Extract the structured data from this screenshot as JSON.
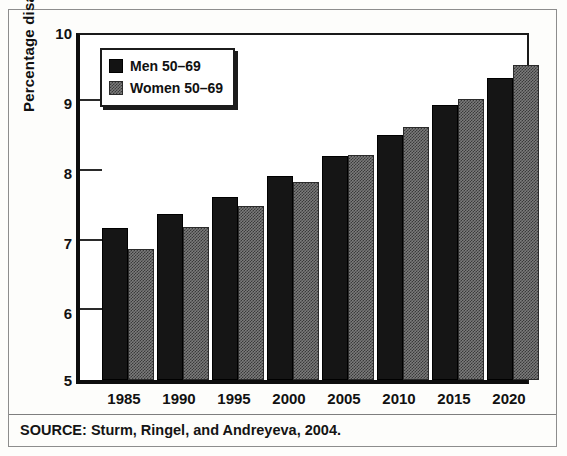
{
  "chart_data": {
    "type": "bar",
    "title": "",
    "xlabel": "",
    "ylabel": "Percentage disabled",
    "ylim": [
      5,
      10
    ],
    "yticks": [
      5,
      6,
      7,
      8,
      9,
      10
    ],
    "grid": false,
    "legend_position": "top-left",
    "categories": [
      "1985",
      "1990",
      "1995",
      "2000",
      "2005",
      "2010",
      "2015",
      "2020"
    ],
    "series": [
      {
        "name": "Men 50–69",
        "values": [
          7.2,
          7.4,
          7.65,
          7.95,
          8.25,
          8.55,
          8.98,
          9.38
        ]
      },
      {
        "name": "Women 50–69",
        "values": [
          6.9,
          7.22,
          7.52,
          7.87,
          8.26,
          8.67,
          9.08,
          9.57
        ]
      }
    ],
    "annotations": [
      "SOURCE: Sturm, Ringel, and Andreyeva, 2004."
    ]
  },
  "axis": {
    "y_title": "Percentage disabled",
    "y_tick_labels": [
      "10",
      "9",
      "8",
      "7",
      "6",
      "5"
    ],
    "x_tick_labels": [
      "1985",
      "1990",
      "1995",
      "2000",
      "2005",
      "2010",
      "2015",
      "2020"
    ]
  },
  "legend": {
    "items": [
      {
        "label": "Men 50–69",
        "swatch": "solid-black-swatch"
      },
      {
        "label": "Women 50–69",
        "swatch": "gray-hatched-swatch"
      }
    ]
  },
  "source": {
    "text": "SOURCE: Sturm, Ringel, and Andreyeva, 2004."
  },
  "colors": {
    "men_bar": "#151515",
    "women_bar": "#7b7b7b",
    "axis": "#0d0d0d",
    "text": "#111111",
    "page_background": "#fdfdfb"
  }
}
